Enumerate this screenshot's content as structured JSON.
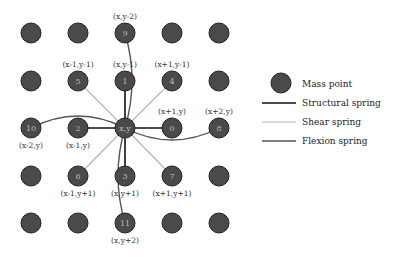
{
  "grid": {
    "cols": [
      31,
      78,
      125,
      172,
      219
    ],
    "rows": [
      33,
      81,
      128,
      176,
      223
    ],
    "radius": 10,
    "node_fill": "#4a4a4a",
    "node_stroke": "#222222"
  },
  "nodes": [
    {
      "col": 2,
      "row": 0,
      "id": "9",
      "coord": "(x,y-2)",
      "label_pos": "above"
    },
    {
      "col": 1,
      "row": 1,
      "id": "5",
      "coord": "(x-1,y-1)",
      "label_pos": "above"
    },
    {
      "col": 2,
      "row": 1,
      "id": "1",
      "coord": "(x,y-1)",
      "label_pos": "above"
    },
    {
      "col": 3,
      "row": 1,
      "id": "4",
      "coord": "(x+1,y-1)",
      "label_pos": "above"
    },
    {
      "col": 0,
      "row": 2,
      "id": "10",
      "coord": "(x-2,y)",
      "label_pos": "below"
    },
    {
      "col": 1,
      "row": 2,
      "id": "2",
      "coord": "(x-1,y)",
      "label_pos": "below"
    },
    {
      "col": 2,
      "row": 2,
      "id": "x,y",
      "coord": "",
      "label_pos": "none"
    },
    {
      "col": 3,
      "row": 2,
      "id": "0",
      "coord": "(x+1,y)",
      "label_pos": "above"
    },
    {
      "col": 4,
      "row": 2,
      "id": "8",
      "coord": "(x+2,y)",
      "label_pos": "above"
    },
    {
      "col": 1,
      "row": 3,
      "id": "6",
      "coord": "(x-1,y+1)",
      "label_pos": "below"
    },
    {
      "col": 2,
      "row": 3,
      "id": "3",
      "coord": "(x,y+1)",
      "label_pos": "below"
    },
    {
      "col": 3,
      "row": 3,
      "id": "7",
      "coord": "(x+1,y+1)",
      "label_pos": "below"
    },
    {
      "col": 2,
      "row": 4,
      "id": "11",
      "coord": "(x,y+2)",
      "label_pos": "below"
    }
  ],
  "springs": {
    "structural": [
      "0",
      "1",
      "2",
      "3"
    ],
    "shear": [
      "4",
      "5",
      "6",
      "7"
    ],
    "flexion": [
      "8",
      "9",
      "10",
      "11"
    ]
  },
  "colors": {
    "structural": "#111111",
    "shear": "#b8b8b8",
    "flexion": "#555555"
  },
  "legend": {
    "mass_point": "Mass point",
    "structural": "Structural spring",
    "shear": "Shear spring",
    "flexion": "Flexion spring"
  }
}
